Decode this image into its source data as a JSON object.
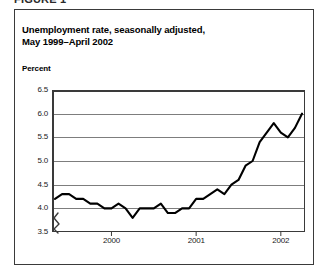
{
  "figure": {
    "label": "FIGURE 1",
    "title_line1": "Unemployment rate, seasonally adjusted,",
    "title_line2": "May 1999–April 2002",
    "axis_title": "Percent"
  },
  "chart_data": {
    "type": "line",
    "title": "Unemployment rate, seasonally adjusted, May 1999–April 2002",
    "xlabel": "",
    "ylabel": "Percent",
    "ylim": [
      3.5,
      6.5
    ],
    "y_ticks": [
      "6.5",
      "6.0",
      "5.5",
      "5.0",
      "4.5",
      "4.0",
      "3.5"
    ],
    "y_tick_values": [
      6.5,
      6.0,
      5.5,
      5.0,
      4.5,
      4.0,
      3.5
    ],
    "y_axis_break": true,
    "y_axis_break_between": [
      3.5,
      4.0
    ],
    "grid": true,
    "grid_axis": "y",
    "legend": "none",
    "line_color": "#000000",
    "x_tick_labels": [
      "2000",
      "2001",
      "2002"
    ],
    "x_tick_positions": [
      "2000-01",
      "2001-01",
      "2002-01"
    ],
    "x_range": [
      "1999-05",
      "2002-04"
    ],
    "x": [
      "1999-05",
      "1999-06",
      "1999-07",
      "1999-08",
      "1999-09",
      "1999-10",
      "1999-11",
      "1999-12",
      "2000-01",
      "2000-02",
      "2000-03",
      "2000-04",
      "2000-05",
      "2000-06",
      "2000-07",
      "2000-08",
      "2000-09",
      "2000-10",
      "2000-11",
      "2000-12",
      "2001-01",
      "2001-02",
      "2001-03",
      "2001-04",
      "2001-05",
      "2001-06",
      "2001-07",
      "2001-08",
      "2001-09",
      "2001-10",
      "2001-11",
      "2001-12",
      "2002-01",
      "2002-02",
      "2002-03",
      "2002-04"
    ],
    "values": [
      4.2,
      4.3,
      4.3,
      4.2,
      4.2,
      4.1,
      4.1,
      4.0,
      4.0,
      4.1,
      4.0,
      3.8,
      4.0,
      4.0,
      4.0,
      4.1,
      3.9,
      3.9,
      4.0,
      4.0,
      4.2,
      4.2,
      4.3,
      4.4,
      4.3,
      4.5,
      4.6,
      4.9,
      5.0,
      5.4,
      5.6,
      5.8,
      5.6,
      5.5,
      5.7,
      6.0
    ],
    "series_name": "Unemployment rate"
  }
}
